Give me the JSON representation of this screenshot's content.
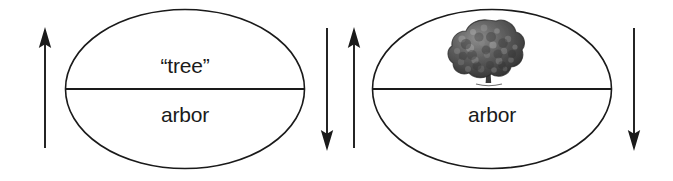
{
  "diagram": {
    "background_color": "#ffffff",
    "stroke_color": "#1a1a1a",
    "text_color": "#1a1a1a"
  },
  "signs": [
    {
      "id": "sign-left",
      "name": "word-form-sign",
      "upper_label": "“tree”",
      "lower_label": "arbor",
      "upper_content_type": "text",
      "lower_content_type": "text"
    },
    {
      "id": "sign-right",
      "name": "picture-form-sign",
      "upper_label": "",
      "lower_label": "arbor",
      "upper_content_type": "image",
      "upper_image_name": "tree-illustration",
      "lower_content_type": "text"
    }
  ],
  "arrows": [
    {
      "id": "arrow-far-left",
      "name": "arrow-up-left",
      "direction": "up",
      "label": ""
    },
    {
      "id": "arrow-mid-down",
      "name": "arrow-down-middle",
      "direction": "down",
      "label": ""
    },
    {
      "id": "arrow-mid-up",
      "name": "arrow-up-middle",
      "direction": "up",
      "label": ""
    },
    {
      "id": "arrow-far-right",
      "name": "arrow-down-right",
      "direction": "down",
      "label": ""
    }
  ]
}
